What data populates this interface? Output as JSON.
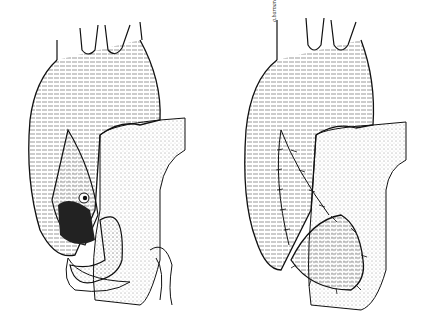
{
  "figure": {
    "panels": [
      {
        "id": "left",
        "caption": "",
        "state": "aortotomy opened exposing interior with patch flap"
      },
      {
        "id": "right",
        "caption": "",
        "state": "incision closed with sutured patch"
      }
    ],
    "signature": "a.barnard",
    "colors": {
      "ink": "#111111",
      "background": "#ffffff"
    }
  }
}
